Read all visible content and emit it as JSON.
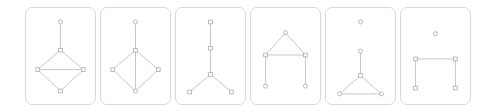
{
  "figure": {
    "type": "graph-panel-series",
    "panel_count": 6,
    "background_color": "#ffffff",
    "panel_border_color": "#d8d8d8",
    "edge_color": "#b8b8b8",
    "node_stroke_color": "#a8a8a8",
    "node_fill_color": "#ffffff"
  },
  "panels": [
    {
      "id": "panel-1",
      "name": "diamond-with-horizontal-chord-and-stem",
      "viewbox": "0 0 71 98",
      "nodes": [
        {
          "id": "n0",
          "shape": "circle",
          "x": 35.5,
          "y": 14
        },
        {
          "id": "n1",
          "shape": "square",
          "x": 35.5,
          "y": 43
        },
        {
          "id": "n2",
          "shape": "square",
          "x": 12,
          "y": 63
        },
        {
          "id": "n3",
          "shape": "square",
          "x": 59,
          "y": 63
        },
        {
          "id": "n4",
          "shape": "square",
          "x": 35.5,
          "y": 85
        }
      ],
      "edges": [
        {
          "from": "n0",
          "to": "n1"
        },
        {
          "from": "n1",
          "to": "n2"
        },
        {
          "from": "n1",
          "to": "n3"
        },
        {
          "from": "n2",
          "to": "n4"
        },
        {
          "from": "n3",
          "to": "n4"
        },
        {
          "from": "n2",
          "to": "n3"
        }
      ]
    },
    {
      "id": "panel-2",
      "name": "diamond-with-vertical-chord-and-stem",
      "viewbox": "0 0 71 98",
      "nodes": [
        {
          "id": "n0",
          "shape": "circle",
          "x": 35.5,
          "y": 14
        },
        {
          "id": "n1",
          "shape": "square",
          "x": 35.5,
          "y": 43
        },
        {
          "id": "n2",
          "shape": "square",
          "x": 12,
          "y": 63
        },
        {
          "id": "n3",
          "shape": "square",
          "x": 59,
          "y": 63
        },
        {
          "id": "n4",
          "shape": "circle",
          "x": 35.5,
          "y": 85
        }
      ],
      "edges": [
        {
          "from": "n0",
          "to": "n1"
        },
        {
          "from": "n1",
          "to": "n2"
        },
        {
          "from": "n1",
          "to": "n3"
        },
        {
          "from": "n2",
          "to": "n4"
        },
        {
          "from": "n3",
          "to": "n4"
        },
        {
          "from": "n1",
          "to": "n4"
        }
      ]
    },
    {
      "id": "panel-3",
      "name": "y-shaped-tree",
      "viewbox": "0 0 71 98",
      "nodes": [
        {
          "id": "n0",
          "shape": "square",
          "x": 35.5,
          "y": 14
        },
        {
          "id": "n1",
          "shape": "square",
          "x": 35.5,
          "y": 41
        },
        {
          "id": "n2",
          "shape": "square",
          "x": 35.5,
          "y": 68
        },
        {
          "id": "n3",
          "shape": "square",
          "x": 14,
          "y": 86
        },
        {
          "id": "n4",
          "shape": "square",
          "x": 57,
          "y": 86
        }
      ],
      "edges": [
        {
          "from": "n0",
          "to": "n1"
        },
        {
          "from": "n1",
          "to": "n2"
        },
        {
          "from": "n2",
          "to": "n3"
        },
        {
          "from": "n2",
          "to": "n4"
        }
      ]
    },
    {
      "id": "panel-4",
      "name": "triangle-with-two-legs",
      "viewbox": "0 0 71 98",
      "nodes": [
        {
          "id": "n0",
          "shape": "circle",
          "x": 35.5,
          "y": 25
        },
        {
          "id": "n1",
          "shape": "square",
          "x": 15,
          "y": 48
        },
        {
          "id": "n2",
          "shape": "square",
          "x": 56,
          "y": 48
        },
        {
          "id": "n3",
          "shape": "circle",
          "x": 15,
          "y": 80
        },
        {
          "id": "n4",
          "shape": "circle",
          "x": 56,
          "y": 80
        }
      ],
      "edges": [
        {
          "from": "n0",
          "to": "n1"
        },
        {
          "from": "n0",
          "to": "n2"
        },
        {
          "from": "n1",
          "to": "n2"
        },
        {
          "from": "n1",
          "to": "n3"
        },
        {
          "from": "n2",
          "to": "n4"
        }
      ]
    },
    {
      "id": "panel-5",
      "name": "isolated-node-plus-triangle-with-stem",
      "viewbox": "0 0 71 98",
      "nodes": [
        {
          "id": "n0",
          "shape": "circle",
          "x": 35.5,
          "y": 14
        },
        {
          "id": "n1",
          "shape": "circle",
          "x": 35.5,
          "y": 44
        },
        {
          "id": "n2",
          "shape": "square",
          "x": 35.5,
          "y": 69
        },
        {
          "id": "n3",
          "shape": "circle",
          "x": 14,
          "y": 88
        },
        {
          "id": "n4",
          "shape": "circle",
          "x": 57,
          "y": 88
        }
      ],
      "edges": [
        {
          "from": "n1",
          "to": "n2"
        },
        {
          "from": "n2",
          "to": "n3"
        },
        {
          "from": "n2",
          "to": "n4"
        },
        {
          "from": "n3",
          "to": "n4"
        }
      ]
    },
    {
      "id": "panel-6",
      "name": "isolated-node-plus-pi-shape",
      "viewbox": "0 0 71 98",
      "nodes": [
        {
          "id": "n0",
          "shape": "circle",
          "x": 35.5,
          "y": 26
        },
        {
          "id": "n1",
          "shape": "square",
          "x": 15,
          "y": 52
        },
        {
          "id": "n2",
          "shape": "square",
          "x": 56,
          "y": 52
        },
        {
          "id": "n3",
          "shape": "square",
          "x": 15,
          "y": 82
        },
        {
          "id": "n4",
          "shape": "square",
          "x": 56,
          "y": 82
        }
      ],
      "edges": [
        {
          "from": "n1",
          "to": "n2"
        },
        {
          "from": "n1",
          "to": "n3"
        },
        {
          "from": "n2",
          "to": "n4"
        }
      ]
    }
  ]
}
